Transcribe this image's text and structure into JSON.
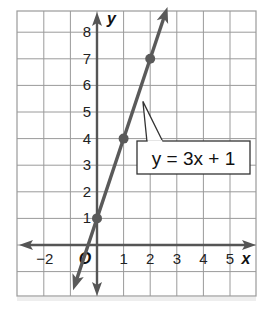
{
  "chart_data": {
    "type": "line",
    "title": "",
    "xlabel": "x",
    "ylabel": "y",
    "origin_label": "O",
    "xlim": [
      -3,
      6
    ],
    "ylim": [
      -2,
      9
    ],
    "grid": true,
    "x_ticks": [
      "−2",
      "1",
      "2",
      "3",
      "4",
      "5"
    ],
    "x_tick_values": [
      -2,
      1,
      2,
      3,
      4,
      5
    ],
    "y_ticks": [
      "1",
      "2",
      "3",
      "4",
      "5",
      "6",
      "7",
      "8"
    ],
    "y_tick_values": [
      1,
      2,
      3,
      4,
      5,
      6,
      7,
      8
    ],
    "series": [
      {
        "name": "y = 3x + 1",
        "equation": "y = 3x + 1",
        "slope": 3,
        "intercept": 1,
        "marked_points": [
          [
            0,
            1
          ],
          [
            1,
            4
          ],
          [
            2,
            7
          ]
        ],
        "x_range_drawn": [
          -0.9,
          2.65
        ],
        "color": "#5a5a5a"
      }
    ],
    "annotations": [
      {
        "text": "y = 3x + 1",
        "type": "callout-box",
        "points_to": [
          1.65,
          5.4
        ]
      }
    ]
  },
  "labels": {
    "equation": "y = 3x + 1"
  },
  "colors": {
    "grid": "#9a9a9a",
    "axis": "#555555",
    "line": "#5a5a5a",
    "text": "#222222"
  }
}
